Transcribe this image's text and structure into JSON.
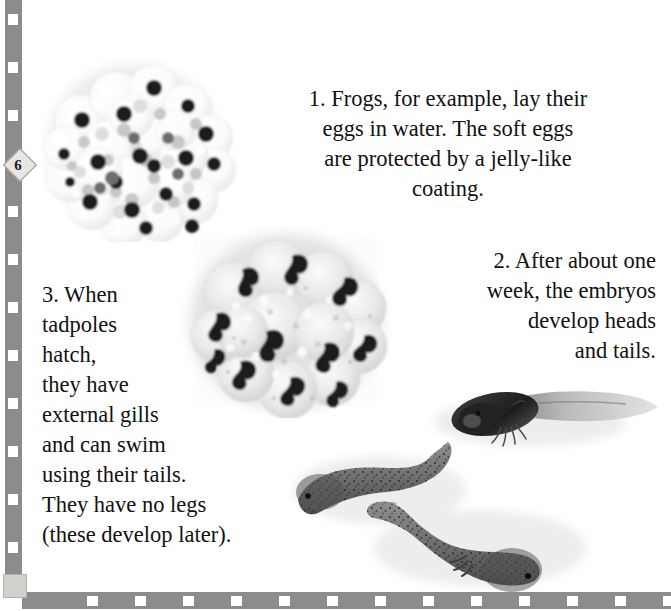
{
  "page": {
    "number": "6",
    "background_color": "#ffffff",
    "text_color": "#111111",
    "border_color": "#8c8c8c",
    "badge_color": "#e8e6e3"
  },
  "border": {
    "left_strip_name": "dashed-rule-left",
    "bottom_strip_name": "dashed-rule-bottom"
  },
  "captions": [
    {
      "id": "caption-1",
      "number": "1.",
      "text": "1. Frogs, for example, lay their\neggs in water.  The soft eggs\nare protected by a jelly-like\ncoating.",
      "align": "center"
    },
    {
      "id": "caption-2",
      "number": "2.",
      "text": "2. After about one\nweek, the embryos\ndevelop heads\nand tails.",
      "align": "right"
    },
    {
      "id": "caption-3",
      "number": "3.",
      "text": "3. When\ntadpoles\nhatch,\nthey have\nexternal gills\nand can swim\nusing their tails.\nThey have no legs\n(these develop later).",
      "align": "left"
    }
  ],
  "figures": [
    {
      "id": "spawn-photo",
      "name": "frog-spawn-egg-mass-photo",
      "description": "Cluster of translucent frog eggs with dark embryo dots",
      "stage": "eggs"
    },
    {
      "id": "embryo-photo",
      "name": "frog-embryo-mass-photo",
      "description": "Jelly mass with comma-shaped embryos having heads and tails",
      "stage": "embryos"
    },
    {
      "id": "tadpole-photo",
      "name": "tadpoles-photo",
      "description": "Three tadpoles with external gills and long tails",
      "stage": "tadpoles"
    }
  ]
}
